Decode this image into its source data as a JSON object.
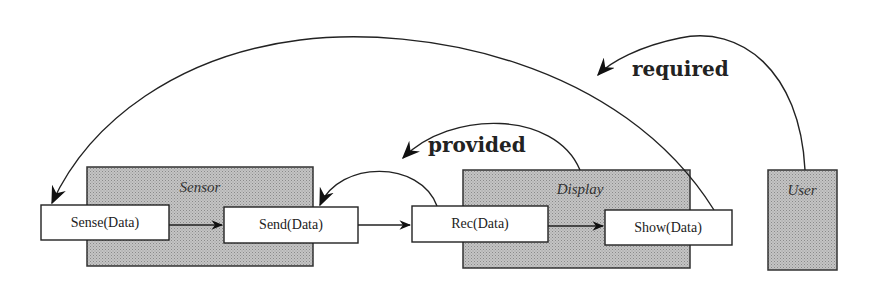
{
  "diagram": {
    "groups": [
      {
        "id": "sensor",
        "label": "Sensor"
      },
      {
        "id": "display",
        "label": "Display"
      },
      {
        "id": "user",
        "label": "User"
      }
    ],
    "nodes": [
      {
        "id": "sense",
        "label": "Sense(Data)",
        "group": "sensor"
      },
      {
        "id": "send",
        "label": "Send(Data)",
        "group": "sensor"
      },
      {
        "id": "rec",
        "label": "Rec(Data)",
        "group": "display"
      },
      {
        "id": "show",
        "label": "Show(Data)",
        "group": "display"
      }
    ],
    "edges": [
      {
        "from": "sense",
        "to": "send",
        "label": ""
      },
      {
        "from": "send",
        "to": "rec",
        "label": ""
      },
      {
        "from": "rec",
        "to": "show",
        "label": ""
      },
      {
        "from": "display",
        "to": "send",
        "label": "provided"
      },
      {
        "from": "user",
        "to": "sense",
        "label": "required"
      }
    ],
    "colors": {
      "group_fill": "#b8b8b8",
      "node_fill": "#ffffff",
      "stroke": "#222222"
    }
  }
}
